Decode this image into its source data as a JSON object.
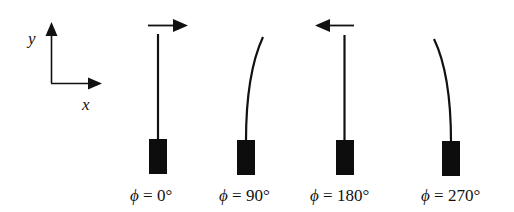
{
  "diagram": {
    "type": "cantilever-deflection-phases",
    "colors": {
      "ink": "#111111",
      "background": "#ffffff"
    },
    "axes": {
      "y_label": "y",
      "x_label": "x"
    },
    "panels": [
      {
        "id": "phi-0",
        "phase_symbol": "ϕ",
        "equals": " = ",
        "value": "0°",
        "label": "ϕ = 0°",
        "force_arrow": "right",
        "beam_shape": "straight"
      },
      {
        "id": "phi-90",
        "phase_symbol": "ϕ",
        "equals": " = ",
        "value": "90°",
        "label": "ϕ = 90°",
        "force_arrow": "none",
        "beam_shape": "bent-right"
      },
      {
        "id": "phi-180",
        "phase_symbol": "ϕ",
        "equals": " = ",
        "value": "180°",
        "label": "ϕ = 180°",
        "force_arrow": "left",
        "beam_shape": "straight"
      },
      {
        "id": "phi-270",
        "phase_symbol": "ϕ",
        "equals": " = ",
        "value": "270°",
        "label": "ϕ = 270°",
        "force_arrow": "none",
        "beam_shape": "bent-left"
      }
    ]
  }
}
